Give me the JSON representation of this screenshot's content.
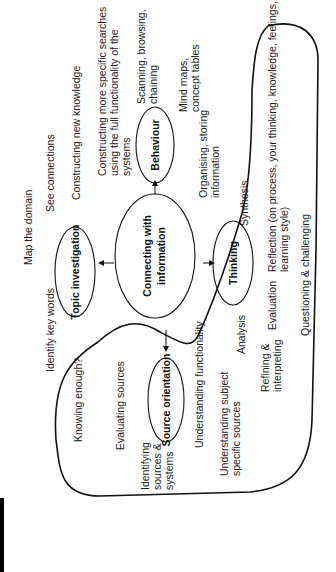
{
  "diagram": {
    "orientation": "rotated 90 degrees counter-clockwise",
    "center_node": {
      "line1": "Connecting with",
      "line2": "information"
    },
    "nodes": {
      "topic": "Topic investigation",
      "behaviour": "Behaviour",
      "thinking": "Thinking",
      "source": "Source orientation"
    },
    "labels": {
      "map_domain": "Map the domain",
      "see_connections": "See connections",
      "constructing_new": "Constructing new knowledge",
      "constructing_specific_1": "Constructing more specific searches",
      "constructing_specific_2": "using the full functionality of the",
      "constructing_specific_3": "systems",
      "scanning_1": "Scanning, browsing,",
      "scanning_2": "chaining",
      "mind_maps_1": "Mind maps,",
      "mind_maps_2": "concept tables",
      "organising_1": "Organising, storing",
      "organising_2": "information",
      "synthesis": "Synthesis",
      "reflection_1": "Reflection (on process, your thinking, knowledge, feelings,",
      "reflection_2": "learning style)",
      "questioning": "Questioning & challenging",
      "evaluation": "Evaluation",
      "analysis": "Analysis",
      "refining_1": "Refining &",
      "refining_2": "interpreting",
      "identify_key": "Identify key words",
      "knowing_enough": "Knowing enough?",
      "evaluating_sources": "Evaluating sources",
      "identifying_1": "Identifying",
      "identifying_2": "sources &",
      "identifying_3": "systems",
      "understanding_functionality": "Understanding functionality",
      "understanding_subject_1": "Understanding subject",
      "understanding_subject_2": "specific sources"
    }
  }
}
